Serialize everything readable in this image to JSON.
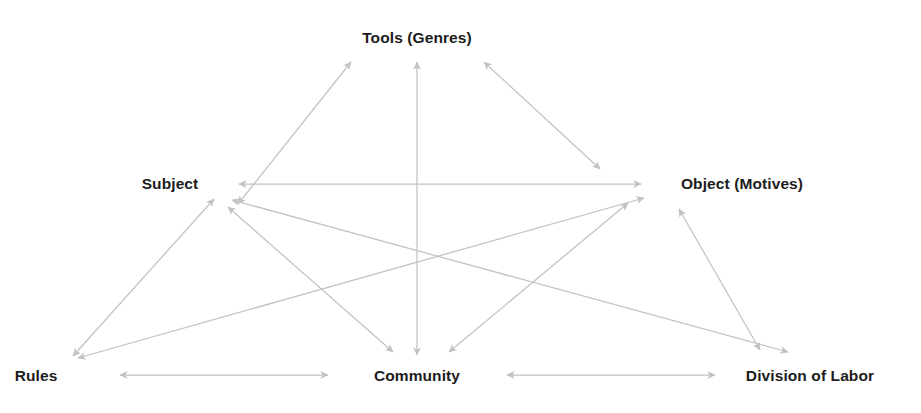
{
  "diagram": {
    "background_color": "#ffffff",
    "edge_color": "#c2c2c2",
    "label_color": "#1c1c1c",
    "nodes": [
      {
        "id": "tools",
        "label": "Tools (Genres)",
        "x": 417,
        "y": 38,
        "anchor": "center"
      },
      {
        "id": "subject",
        "label": "Subject",
        "x": 170,
        "y": 184,
        "anchor": "center"
      },
      {
        "id": "object",
        "label": "Object (Motives)",
        "x": 742,
        "y": 184,
        "anchor": "center"
      },
      {
        "id": "rules",
        "label": "Rules",
        "x": 36,
        "y": 376,
        "anchor": "center"
      },
      {
        "id": "community",
        "label": "Community",
        "x": 417,
        "y": 376,
        "anchor": "center"
      },
      {
        "id": "division",
        "label": "Division of Labor",
        "x": 810,
        "y": 376,
        "anchor": "center"
      }
    ],
    "edges": [
      {
        "id": "subject-tools",
        "from": "subject",
        "to": "tools",
        "x1": 238,
        "y1": 204,
        "x2": 351,
        "y2": 62,
        "arrows": "both"
      },
      {
        "id": "tools-object",
        "from": "tools",
        "to": "object",
        "x1": 484,
        "y1": 62,
        "x2": 600,
        "y2": 169,
        "arrows": "both"
      },
      {
        "id": "subject-object",
        "from": "subject",
        "to": "object",
        "x1": 239,
        "y1": 184,
        "x2": 641,
        "y2": 184,
        "arrows": "both"
      },
      {
        "id": "tools-community",
        "from": "tools",
        "to": "community",
        "x1": 417,
        "y1": 62,
        "x2": 417,
        "y2": 355,
        "arrows": "both"
      },
      {
        "id": "subject-rules",
        "from": "subject",
        "to": "rules",
        "x1": 214,
        "y1": 199,
        "x2": 73,
        "y2": 356,
        "arrows": "both"
      },
      {
        "id": "subject-community",
        "from": "subject",
        "to": "community",
        "x1": 228,
        "y1": 207,
        "x2": 393,
        "y2": 352,
        "arrows": "both"
      },
      {
        "id": "subject-division",
        "from": "subject",
        "to": "division",
        "x1": 232,
        "y1": 200,
        "x2": 788,
        "y2": 352,
        "arrows": "both"
      },
      {
        "id": "object-rules",
        "from": "object",
        "to": "rules",
        "x1": 644,
        "y1": 198,
        "x2": 78,
        "y2": 358,
        "arrows": "both"
      },
      {
        "id": "object-community",
        "from": "object",
        "to": "community",
        "x1": 628,
        "y1": 203,
        "x2": 449,
        "y2": 352,
        "arrows": "both"
      },
      {
        "id": "object-division",
        "from": "object",
        "to": "division",
        "x1": 679,
        "y1": 209,
        "x2": 760,
        "y2": 350,
        "arrows": "both"
      },
      {
        "id": "rules-community",
        "from": "rules",
        "to": "community",
        "x1": 120,
        "y1": 375,
        "x2": 328,
        "y2": 375,
        "arrows": "both"
      },
      {
        "id": "community-division",
        "from": "community",
        "to": "division",
        "x1": 507,
        "y1": 375,
        "x2": 715,
        "y2": 375,
        "arrows": "both"
      }
    ]
  }
}
